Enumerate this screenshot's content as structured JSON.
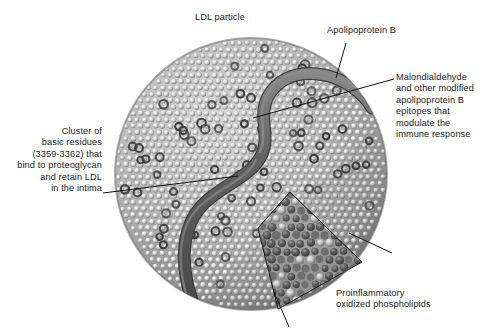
{
  "figure": {
    "subject": "LDL particle",
    "labels": {
      "ldl_particle": "LDL particle",
      "apolipoprotein_b": "Apolipoprotein B",
      "malondialdehyde": "Malondialdehyde\nand other modified\napolipoprotein B\nepitopes that\nmodulate the\nimmune response",
      "basic_residues_cluster": "Cluster of\nbasic residues\n(3359-3362) that\nbind to proteoglycan\nand retain LDL\nin the intima",
      "oxidized_phospholipids": "Proinflammatory\noxidized phospholipids"
    },
    "colors": {
      "background": "#ffffff",
      "text": "#1b1b1b",
      "leader_line": "#111111",
      "particle_surface_light": "#c9c9c9",
      "particle_surface_mid": "#9a9a9a",
      "particle_shadow": "#6e6e6e",
      "phospholipid_head_light": "#e8e8e8",
      "oxidized_lipid_dark": "#555555",
      "apob_ribbon": "#5c5c5c",
      "apob_ribbon_highlight": "#7d7d7d",
      "inset_background": "#8e8e8e"
    },
    "geometry": {
      "particle_center_x": 251,
      "particle_center_y": 174,
      "particle_radius": 136,
      "inset_apex_x": 290,
      "inset_apex_y": 192
    }
  }
}
